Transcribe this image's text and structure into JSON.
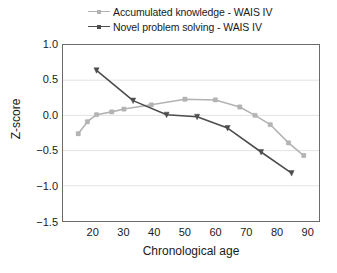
{
  "chart_data": {
    "type": "line",
    "title": "",
    "xlabel": "Chronological age",
    "ylabel": "Z-score",
    "xlim": [
      10,
      94
    ],
    "ylim": [
      -1.5,
      1.0
    ],
    "xticks": [
      20,
      30,
      40,
      50,
      60,
      70,
      80,
      90
    ],
    "xtick_labels": [
      "20",
      "30",
      "40",
      "50",
      "60",
      "70",
      "80",
      "90"
    ],
    "yticks": [
      1.0,
      0.5,
      0.0,
      -0.5,
      -1.0,
      -1.5
    ],
    "ytick_labels": [
      "1.0",
      "0.5",
      "0.0",
      "−0.5",
      "−1.0",
      "−1.5"
    ],
    "grid": "horizontal",
    "legend_position": "above-plot",
    "series": [
      {
        "name": "Accumulated knowledge - WAIS IV",
        "color": "#b3b3b3",
        "marker": "square",
        "x": [
          15,
          18,
          21,
          26,
          30,
          39,
          50,
          60,
          68,
          73,
          78,
          84,
          89
        ],
        "values": [
          -0.26,
          -0.09,
          0.01,
          0.05,
          0.09,
          0.15,
          0.23,
          0.22,
          0.12,
          0.0,
          -0.13,
          -0.39,
          -0.57
        ]
      },
      {
        "name": "Novel problem solving - WAIS IV",
        "color": "#4d4d4d",
        "marker": "triangle",
        "x": [
          21,
          33,
          44,
          54,
          64,
          75,
          85
        ],
        "values": [
          0.64,
          0.21,
          0.01,
          -0.02,
          -0.18,
          -0.52,
          -0.82
        ]
      }
    ]
  },
  "legend": {
    "items": [
      {
        "label": "Accumulated knowledge - WAIS IV",
        "color": "#b3b3b3"
      },
      {
        "label": "Novel problem solving - WAIS IV",
        "color": "#4d4d4d"
      }
    ]
  },
  "axes": {
    "frame_color": "#6b6b6b",
    "grid_color": "#e2e2e2"
  }
}
